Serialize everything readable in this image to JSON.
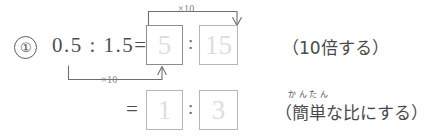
{
  "worksheet": {
    "problem_number": "①",
    "expression_lhs": "0.5 : 1.5=",
    "equals_row2": "=",
    "ratio_colon": ":",
    "row1": {
      "box_left_value": "5",
      "box_right_value": "15",
      "note": "（10倍する）"
    },
    "row2": {
      "box_left_value": "1",
      "box_right_value": "3",
      "note": "（簡単な比にする）",
      "furigana": "かんたん"
    },
    "multipliers": {
      "top_label": "×10",
      "bottom_label": "×10"
    },
    "colors": {
      "ink": "#4a4a4a",
      "box_border": "#b6b6b6",
      "answer_text": "#dedede",
      "bracket": "#6f6f6f",
      "paper": "#ffffff"
    }
  }
}
